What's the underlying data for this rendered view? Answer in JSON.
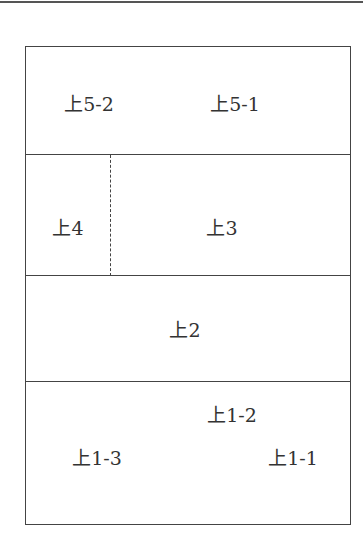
{
  "diagram": {
    "type": "stacked-layout-plan",
    "rows": [
      {
        "id": "row5",
        "cells": [
          {
            "label": "上5-2"
          },
          {
            "label": "上5-1"
          }
        ]
      },
      {
        "id": "row4-3",
        "cells": [
          {
            "label": "上4"
          },
          {
            "label": "上3"
          }
        ]
      },
      {
        "id": "row2",
        "cells": [
          {
            "label": "上2"
          }
        ]
      },
      {
        "id": "row1",
        "cells": [
          {
            "label": "上1-2"
          },
          {
            "label": "上1-3"
          },
          {
            "label": "上1-1"
          }
        ]
      }
    ]
  }
}
